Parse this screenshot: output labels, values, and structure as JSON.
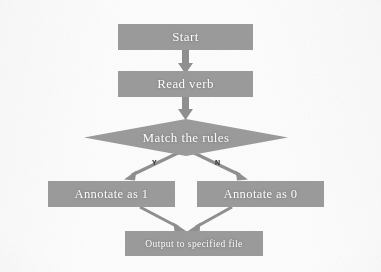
{
  "diagram": {
    "type": "flowchart",
    "orientation": "top-to-bottom",
    "colors": {
      "node_fill": "#9a9a9a",
      "node_text": "#ffffff",
      "arrow": "#8f8f8f",
      "branch_label": "#3a3a3a",
      "background": "#fdfdfd"
    },
    "nodes": [
      {
        "id": "start",
        "shape": "rectangle",
        "label": "Start"
      },
      {
        "id": "read_verb",
        "shape": "rectangle",
        "label": "Read verb"
      },
      {
        "id": "match_rules",
        "shape": "diamond",
        "label": "Match the rules"
      },
      {
        "id": "annotate_one",
        "shape": "rectangle",
        "label": "Annotate as 1"
      },
      {
        "id": "annotate_zero",
        "shape": "rectangle",
        "label": "Annotate as 0"
      },
      {
        "id": "output_file",
        "shape": "rectangle",
        "label": "Output to specified file"
      }
    ],
    "edges": [
      {
        "from": "start",
        "to": "read_verb",
        "label": ""
      },
      {
        "from": "read_verb",
        "to": "match_rules",
        "label": ""
      },
      {
        "from": "match_rules",
        "to": "annotate_one",
        "label": "Y"
      },
      {
        "from": "match_rules",
        "to": "annotate_zero",
        "label": "N"
      },
      {
        "from": "annotate_one",
        "to": "output_file",
        "label": ""
      },
      {
        "from": "annotate_zero",
        "to": "output_file",
        "label": ""
      }
    ],
    "branch_labels": {
      "yes": "Y",
      "no": "N"
    }
  }
}
